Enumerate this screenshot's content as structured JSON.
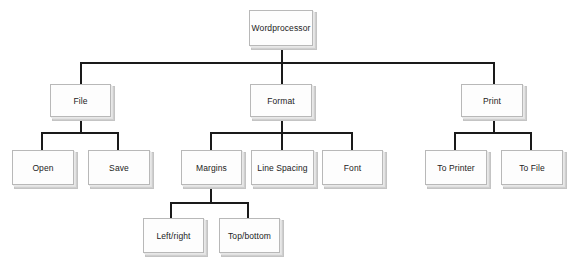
{
  "diagram": {
    "type": "tree",
    "root": {
      "label": "Wordprocessor",
      "children": [
        {
          "label": "File",
          "children": [
            {
              "label": "Open"
            },
            {
              "label": "Save"
            }
          ]
        },
        {
          "label": "Format",
          "children": [
            {
              "label": "Margins",
              "children": [
                {
                  "label": "Left/right"
                },
                {
                  "label": "Top/bottom"
                }
              ]
            },
            {
              "label": "Line Spacing"
            },
            {
              "label": "Font"
            }
          ]
        },
        {
          "label": "Print",
          "children": [
            {
              "label": "To Printer"
            },
            {
              "label": "To File"
            }
          ]
        }
      ]
    }
  },
  "nodes": {
    "wordprocessor": "Wordprocessor",
    "file": "File",
    "format": "Format",
    "print": "Print",
    "open": "Open",
    "save": "Save",
    "margins": "Margins",
    "line_spacing": "Line Spacing",
    "font": "Font",
    "to_printer": "To Printer",
    "to_file": "To File",
    "left_right": "Left/right",
    "top_bottom": "Top/bottom"
  },
  "colors": {
    "line": "#1a1a1a",
    "box_fill": "#fdfdfd",
    "box_border": "#b8b8b8",
    "text": "#222222"
  }
}
